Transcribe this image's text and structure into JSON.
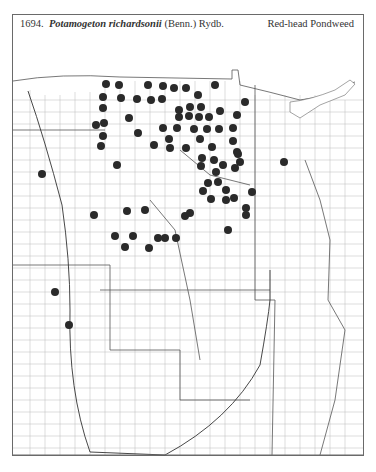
{
  "caption": {
    "number": "1694.",
    "scientific_name": "Potamogeton richardsonii",
    "authority": "(Benn.) Rydb.",
    "common_name": "Red-head Pondweed"
  },
  "map": {
    "region": "Great Plains counties",
    "dot_color": "#2a2a2a",
    "line_color": "#8a8a8a",
    "dots": [
      [
        106,
        84
      ],
      [
        119,
        85
      ],
      [
        148,
        85
      ],
      [
        163,
        86
      ],
      [
        174,
        88
      ],
      [
        186,
        88
      ],
      [
        215,
        85
      ],
      [
        103,
        97
      ],
      [
        121,
        98
      ],
      [
        137,
        99
      ],
      [
        151,
        100
      ],
      [
        162,
        99
      ],
      [
        198,
        95
      ],
      [
        245,
        102
      ],
      [
        103,
        108
      ],
      [
        190,
        107
      ],
      [
        201,
        107
      ],
      [
        220,
        111
      ],
      [
        179,
        110
      ],
      [
        179,
        117
      ],
      [
        189,
        116
      ],
      [
        199,
        117
      ],
      [
        209,
        117
      ],
      [
        237,
        115
      ],
      [
        96,
        125
      ],
      [
        104,
        123
      ],
      [
        129,
        118
      ],
      [
        163,
        128
      ],
      [
        177,
        128
      ],
      [
        194,
        129
      ],
      [
        207,
        129
      ],
      [
        219,
        129
      ],
      [
        233,
        128
      ],
      [
        138,
        133
      ],
      [
        103,
        136
      ],
      [
        169,
        139
      ],
      [
        200,
        139
      ],
      [
        233,
        141
      ],
      [
        101,
        146
      ],
      [
        154,
        145
      ],
      [
        170,
        148
      ],
      [
        186,
        148
      ],
      [
        212,
        147
      ],
      [
        237,
        152
      ],
      [
        42,
        174
      ],
      [
        117,
        165
      ],
      [
        202,
        158
      ],
      [
        201,
        166
      ],
      [
        214,
        160
      ],
      [
        223,
        165
      ],
      [
        238,
        154
      ],
      [
        240,
        162
      ],
      [
        235,
        168
      ],
      [
        216,
        172
      ],
      [
        208,
        183
      ],
      [
        218,
        182
      ],
      [
        203,
        191
      ],
      [
        226,
        190
      ],
      [
        252,
        192
      ],
      [
        211,
        199
      ],
      [
        226,
        200
      ],
      [
        234,
        198
      ],
      [
        246,
        208
      ],
      [
        246,
        215
      ],
      [
        228,
        230
      ],
      [
        284,
        162
      ],
      [
        94,
        215
      ],
      [
        127,
        211
      ],
      [
        145,
        210
      ],
      [
        185,
        216
      ],
      [
        190,
        213
      ],
      [
        115,
        236
      ],
      [
        133,
        236
      ],
      [
        149,
        248
      ],
      [
        158,
        238
      ],
      [
        165,
        238
      ],
      [
        176,
        238
      ],
      [
        125,
        247
      ],
      [
        55,
        292
      ],
      [
        69,
        325
      ]
    ]
  }
}
